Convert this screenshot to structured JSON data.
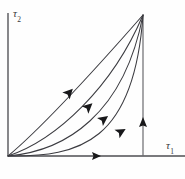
{
  "figure": {
    "kind": "phase-plane-trajectory-diagram",
    "width": 185,
    "height": 179,
    "background_color": "#fefefe",
    "ink_color": "#3b3b40"
  },
  "axes": {
    "vertical": {
      "label_symbol": "τ",
      "label_subscript": "2",
      "name": "tau-2",
      "origin": [
        8,
        156
      ],
      "end": [
        8,
        13
      ],
      "color": "#4e4e52"
    },
    "horizontal": {
      "label_symbol": "τ",
      "label_subscript": "1",
      "name": "tau-1",
      "origin": [
        8,
        156
      ],
      "end": [
        185,
        156
      ],
      "arrow_at_x": 100,
      "color": "#4e4e52"
    }
  },
  "corner_point": [
    143,
    15
  ],
  "drop_line": {
    "name": "right-vertical-line",
    "from": [
      143,
      15
    ],
    "to": [
      143,
      156
    ],
    "arrow_at": [
      143,
      122
    ],
    "arrow_direction": "up",
    "color": "#6a6a6e"
  },
  "chart_data": {
    "type": "line",
    "title": "",
    "xlabel": "τ1",
    "ylabel": "τ2",
    "grid": false,
    "legend": "none",
    "series": [
      {
        "name": "trajectory-1-upper",
        "curvature": "nearly-straight",
        "path": "M 8 156 C 44 126, 100 64, 143 15",
        "arrow": {
          "x": 66,
          "y": 96,
          "angle_deg": -47
        }
      },
      {
        "name": "trajectory-2",
        "curvature": "slight-convex",
        "path": "M 8 156 C 56 140, 112 88, 143 15",
        "arrow": {
          "x": 85,
          "y": 110,
          "angle_deg": -42
        }
      },
      {
        "name": "trajectory-3",
        "curvature": "convex",
        "path": "M 8 156 C 66 151, 124 114, 143 15",
        "arrow": {
          "x": 100,
          "y": 122,
          "angle_deg": -36
        }
      },
      {
        "name": "trajectory-4-lower",
        "curvature": "strong-convex",
        "path": "M 8 156 C 80 157, 134 142, 143 15",
        "arrow": {
          "x": 117,
          "y": 134,
          "angle_deg": -30
        }
      }
    ]
  }
}
